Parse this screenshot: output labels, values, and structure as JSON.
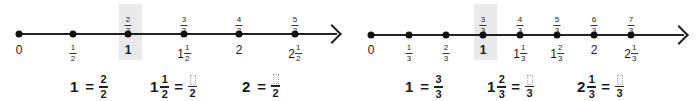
{
  "panels": [
    {
      "id": "halves",
      "denominator": "2",
      "highlight": {
        "left": 119,
        "width": 23
      },
      "line": {
        "x1": 19,
        "x2": 337,
        "y": 34
      },
      "points": [
        {
          "x": 19,
          "top": null,
          "bottom": {
            "whole": "0"
          }
        },
        {
          "x": 73,
          "top": null,
          "bottom": {
            "num": "1",
            "den": "2"
          }
        },
        {
          "x": 128,
          "top": {
            "num": "2",
            "den": "2"
          },
          "bottom": {
            "whole": "1",
            "bold": true
          }
        },
        {
          "x": 184,
          "top": {
            "num": "3",
            "den": "2"
          },
          "bottom": {
            "whole": "1",
            "num": "1",
            "den": "2"
          }
        },
        {
          "x": 239,
          "top": {
            "num": "4",
            "den": "2"
          },
          "bottom": {
            "whole": "2"
          }
        },
        {
          "x": 295,
          "top": {
            "num": "5",
            "den": "2"
          },
          "bottom": {
            "whole": "2",
            "num": "1",
            "den": "2"
          }
        }
      ],
      "equations": [
        {
          "x": 70,
          "lhs": {
            "whole": "1"
          },
          "op": "=",
          "rhs": {
            "num": "2",
            "den": "2"
          }
        },
        {
          "x": 150,
          "lhs": {
            "whole": "1",
            "num": "1",
            "den": "2"
          },
          "op": "=",
          "rhs": {
            "num": "",
            "den": "2",
            "blank": true
          }
        },
        {
          "x": 242,
          "lhs": {
            "whole": "2"
          },
          "op": "=",
          "rhs": {
            "num": "",
            "den": "2",
            "blank": true
          }
        }
      ]
    },
    {
      "id": "thirds",
      "denominator": "3",
      "highlight": {
        "left": 474,
        "width": 23
      },
      "line": {
        "x1": 371,
        "x2": 684,
        "y": 35
      },
      "points": [
        {
          "x": 371,
          "top": null,
          "bottom": {
            "whole": "0"
          }
        },
        {
          "x": 409,
          "top": null,
          "bottom": {
            "num": "1",
            "den": "3"
          }
        },
        {
          "x": 446,
          "top": null,
          "bottom": {
            "num": "2",
            "den": "3"
          }
        },
        {
          "x": 483,
          "top": {
            "num": "3",
            "den": "3"
          },
          "bottom": {
            "whole": "1",
            "bold": true
          }
        },
        {
          "x": 520,
          "top": {
            "num": "4",
            "den": "3"
          },
          "bottom": {
            "whole": "1",
            "num": "1",
            "den": "3"
          }
        },
        {
          "x": 557,
          "top": {
            "num": "5",
            "den": "3"
          },
          "bottom": {
            "whole": "1",
            "num": "2",
            "den": "3"
          }
        },
        {
          "x": 594,
          "top": {
            "num": "6",
            "den": "3"
          },
          "bottom": {
            "whole": "2"
          }
        },
        {
          "x": 631,
          "top": {
            "num": "7",
            "den": "3"
          },
          "bottom": {
            "whole": "2",
            "num": "1",
            "den": "3"
          }
        }
      ],
      "equations": [
        {
          "x": 405,
          "lhs": {
            "whole": "1"
          },
          "op": "=",
          "rhs": {
            "num": "3",
            "den": "3"
          }
        },
        {
          "x": 487,
          "lhs": {
            "whole": "1",
            "num": "2",
            "den": "3"
          },
          "op": "=",
          "rhs": {
            "num": "",
            "den": "3",
            "blank": true
          }
        },
        {
          "x": 577,
          "lhs": {
            "whole": "2",
            "num": "1",
            "den": "3"
          },
          "op": "=",
          "rhs": {
            "num": "",
            "den": "3",
            "blank": true
          }
        }
      ]
    }
  ]
}
